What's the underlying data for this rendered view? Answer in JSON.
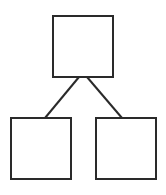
{
  "diagram": {
    "type": "tree",
    "stroke_color": "#2a2a2a",
    "background": "#ffffff",
    "nodes": [
      {
        "id": "root",
        "label": ""
      },
      {
        "id": "left-child",
        "label": ""
      },
      {
        "id": "right-child",
        "label": ""
      }
    ],
    "edges": [
      {
        "from": "root",
        "to": "left-child"
      },
      {
        "from": "root",
        "to": "right-child"
      }
    ]
  }
}
